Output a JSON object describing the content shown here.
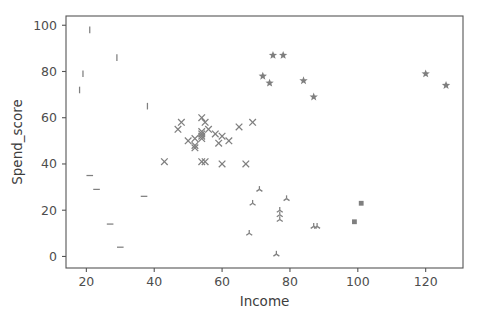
{
  "chart_data": {
    "type": "scatter",
    "title": "",
    "xlabel": "Income",
    "ylabel": "Spend_score",
    "xlim": [
      14,
      131
    ],
    "ylim": [
      -5,
      104
    ],
    "xticks": [
      20,
      40,
      60,
      80,
      100,
      120
    ],
    "yticks": [
      0,
      20,
      40,
      60,
      80,
      100
    ],
    "grid": false,
    "legend": null,
    "marker_color": "#7f7f7f",
    "series": [
      {
        "name": "cluster-vline",
        "marker": "vline",
        "points": [
          [
            21,
            98
          ],
          [
            29,
            86
          ],
          [
            19,
            79
          ],
          [
            18,
            72
          ],
          [
            38,
            65
          ]
        ]
      },
      {
        "name": "cluster-hline",
        "marker": "hline",
        "points": [
          [
            21,
            35
          ],
          [
            23,
            29
          ],
          [
            37,
            26
          ],
          [
            27,
            14
          ],
          [
            30,
            4
          ]
        ]
      },
      {
        "name": "cluster-x",
        "marker": "x",
        "points": [
          [
            47,
            55
          ],
          [
            48,
            58
          ],
          [
            50,
            50
          ],
          [
            52,
            51
          ],
          [
            52,
            48
          ],
          [
            52,
            47
          ],
          [
            54,
            60
          ],
          [
            54,
            54
          ],
          [
            54,
            53
          ],
          [
            54,
            52
          ],
          [
            54,
            51
          ],
          [
            55,
            58
          ],
          [
            56,
            55
          ],
          [
            58,
            53
          ],
          [
            60,
            52
          ],
          [
            59,
            49
          ],
          [
            62,
            50
          ],
          [
            65,
            56
          ],
          [
            69,
            58
          ],
          [
            43,
            41
          ],
          [
            54,
            41
          ],
          [
            55,
            41
          ],
          [
            60,
            40
          ],
          [
            67,
            40
          ]
        ]
      },
      {
        "name": "cluster-star",
        "marker": "star",
        "points": [
          [
            75,
            87
          ],
          [
            78,
            87
          ],
          [
            72,
            78
          ],
          [
            74,
            75
          ],
          [
            84,
            76
          ],
          [
            87,
            69
          ],
          [
            120,
            79
          ],
          [
            126,
            74
          ]
        ]
      },
      {
        "name": "cluster-tri-down",
        "marker": "tri_down",
        "points": [
          [
            71,
            29
          ],
          [
            69,
            23
          ],
          [
            77,
            18
          ],
          [
            77,
            20
          ],
          [
            77,
            16
          ],
          [
            79,
            25
          ],
          [
            87,
            13
          ],
          [
            88,
            13
          ],
          [
            68,
            10
          ],
          [
            76,
            1
          ]
        ]
      },
      {
        "name": "cluster-square",
        "marker": "square",
        "points": [
          [
            101,
            23
          ],
          [
            99,
            15
          ]
        ]
      }
    ]
  }
}
